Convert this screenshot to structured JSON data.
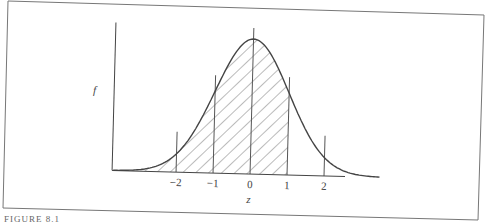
{
  "figure": {
    "caption_fragment": "FIGURE 8.1",
    "y_axis_label": "f",
    "x_axis_label": "z"
  },
  "chart_data": {
    "type": "area",
    "title": "",
    "xlabel": "z",
    "ylabel": "f",
    "x_ticks": [
      -2,
      -1,
      0,
      1,
      2
    ],
    "x_tick_labels": [
      "−2",
      "−1",
      "0",
      "1",
      "2"
    ],
    "xlim": [
      -3.7,
      3.5
    ],
    "ylim": [
      0,
      0.45
    ],
    "curve": "standard normal pdf",
    "shaded_region": {
      "from": "-inf",
      "to": 1,
      "style": "diagonal hatch"
    },
    "vertical_lines_at": [
      -2,
      -1,
      0,
      1,
      2
    ],
    "grid": false,
    "legend": null
  }
}
